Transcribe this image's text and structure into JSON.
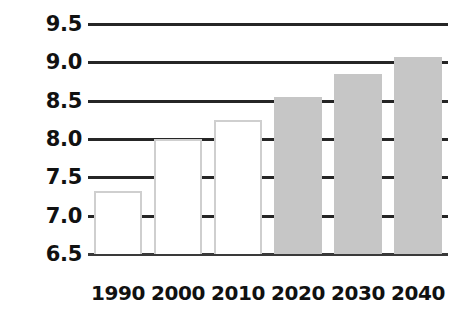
{
  "chart_data": {
    "type": "bar",
    "title": "",
    "subtitle": "",
    "xlabel": "",
    "ylabel": "",
    "categories": [
      "1990",
      "2000",
      "2010",
      "2020",
      "2030",
      "2040"
    ],
    "values": [
      7.32,
      8.0,
      8.25,
      8.55,
      8.85,
      9.07
    ],
    "series": [
      {
        "name": "",
        "values": [
          7.32,
          8.0,
          8.25,
          8.55,
          8.85,
          9.07
        ],
        "bar_styles": [
          "open",
          "open",
          "open",
          "filled",
          "filled",
          "filled"
        ]
      }
    ],
    "ylim": [
      6.5,
      9.5
    ],
    "ytick_values": [
      6.5,
      7.0,
      7.5,
      8.0,
      8.5,
      9.0,
      9.5
    ],
    "ytick_labels": [
      "6.5",
      "7.0",
      "7.5",
      "8.0",
      "8.5",
      "9.0",
      "9.5"
    ],
    "ytick_step": 0.5,
    "grid": true,
    "grid_axis": "y",
    "legend": false,
    "legend_position": "none",
    "annotations": [],
    "colors": {
      "bar_open_fill": "#ffffff",
      "bar_open_stroke": "#cfcfcf",
      "bar_filled_fill": "#c6c6c6",
      "gridline": "#262626",
      "axis_baseline": "#3a3a3a",
      "tick_label": "#111111",
      "background": "#ffffff"
    }
  }
}
